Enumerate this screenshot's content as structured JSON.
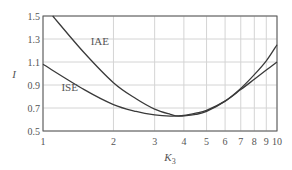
{
  "chart_data": {
    "type": "line",
    "title": "",
    "xlabel": "K",
    "xlabel_sub": "3",
    "ylabel": "I",
    "xscale": "log",
    "xlim": [
      1,
      10
    ],
    "ylim": [
      0.5,
      1.5
    ],
    "x_ticks": [
      1,
      2,
      3,
      4,
      5,
      6,
      7,
      8,
      9,
      10
    ],
    "x_tick_labels": [
      "1",
      "2",
      "3",
      "4",
      "5",
      "6",
      "7",
      "8",
      "9",
      "10"
    ],
    "y_ticks": [
      0.5,
      0.7,
      0.9,
      1.1,
      1.3,
      1.5
    ],
    "y_tick_labels": [
      "0.5",
      "0.7",
      "0.9",
      "1.1",
      "1.3",
      "1.5"
    ],
    "grid": true,
    "legend": "inline labels",
    "series": [
      {
        "name": "IAE",
        "label_pos": {
          "x": 1.75,
          "y": 1.25
        },
        "x": [
          1.1,
          1.5,
          2,
          2.5,
          3,
          3.5,
          3.8,
          4.5,
          5,
          6,
          7,
          8,
          9,
          10
        ],
        "values": [
          1.5,
          1.18,
          0.92,
          0.78,
          0.69,
          0.645,
          0.63,
          0.645,
          0.67,
          0.76,
          0.87,
          0.99,
          1.11,
          1.25
        ]
      },
      {
        "name": "ISE",
        "label_pos": {
          "x": 1.3,
          "y": 0.85
        },
        "x": [
          1,
          1.5,
          2,
          2.5,
          3,
          3.5,
          4,
          4.5,
          5,
          6,
          7,
          8,
          9,
          10
        ],
        "values": [
          1.08,
          0.86,
          0.73,
          0.67,
          0.64,
          0.63,
          0.635,
          0.655,
          0.68,
          0.76,
          0.86,
          0.95,
          1.03,
          1.1
        ]
      }
    ]
  }
}
